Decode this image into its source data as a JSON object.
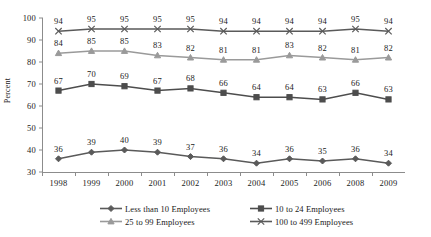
{
  "chart_data": {
    "type": "line",
    "title": "",
    "xlabel": "",
    "ylabel": "Percent",
    "ylim": [
      30,
      100
    ],
    "ytick_step": 10,
    "yticks": [
      30,
      40,
      50,
      60,
      70,
      80,
      90,
      100
    ],
    "grid": false,
    "legend_position": "bottom",
    "data_labels": true,
    "categories": [
      "1998",
      "1999",
      "2000",
      "2001",
      "2002",
      "2003",
      "2004",
      "2005",
      "2006",
      "2008",
      "2009"
    ],
    "series": [
      {
        "name": "Less than 10 Employees",
        "marker": "diamond",
        "color": "#5a5a5a",
        "values": [
          36,
          39,
          40,
          39,
          37,
          36,
          34,
          36,
          35,
          36,
          34
        ]
      },
      {
        "name": "10 to 24 Employees",
        "marker": "square",
        "color": "#4d4d4d",
        "values": [
          67,
          70,
          69,
          67,
          68,
          66,
          64,
          64,
          63,
          66,
          63
        ]
      },
      {
        "name": "25 to 99 Employees",
        "marker": "triangle",
        "color": "#9a9a9a",
        "values": [
          84,
          85,
          85,
          83,
          82,
          81,
          81,
          83,
          82,
          81,
          82
        ]
      },
      {
        "name": "100 to 499 Employees",
        "marker": "cross",
        "color": "#5a5a5a",
        "values": [
          94,
          95,
          95,
          95,
          95,
          94,
          94,
          94,
          94,
          95,
          94
        ]
      }
    ]
  },
  "legend": {
    "entries": [
      {
        "label": "Less than 10 Employees"
      },
      {
        "label": "10 to 24 Employees"
      },
      {
        "label": "25 to 99 Employees"
      },
      {
        "label": "100 to 499 Employees"
      }
    ]
  }
}
